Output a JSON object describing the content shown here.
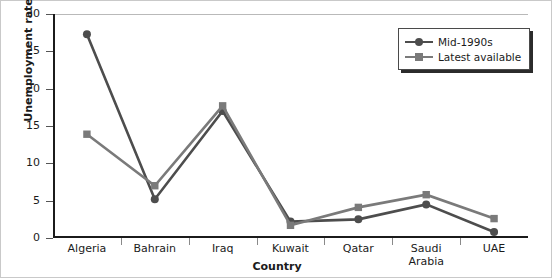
{
  "chart_data": {
    "type": "line",
    "title": "",
    "xlabel": "Country",
    "ylabel": "Unemployment rate (%)",
    "categories": [
      "Algeria",
      "Bahrain",
      "Iraq",
      "Kuwait",
      "Qatar",
      "Saudi Arabia",
      "UAE"
    ],
    "ylim": [
      0,
      30
    ],
    "yticks": [
      0,
      5,
      10,
      15,
      20,
      25,
      30
    ],
    "grid": false,
    "legend_position": "top-right",
    "series": [
      {
        "name": "Mid-1990s",
        "marker": "circle",
        "color": "#4d4d4d",
        "values": [
          27.3,
          5.2,
          17.0,
          2.2,
          2.5,
          4.5,
          0.8
        ]
      },
      {
        "name": "Latest available",
        "marker": "square",
        "color": "#7a7a7a",
        "values": [
          13.9,
          7.0,
          17.7,
          1.7,
          4.1,
          5.8,
          2.6
        ]
      }
    ]
  },
  "axis": {
    "y_tick_labels": [
      "0",
      "5",
      "10",
      "15",
      "20",
      "25",
      "30"
    ],
    "x_tick_labels": [
      "Algeria",
      "Bahrain",
      "Iraq",
      "Kuwait",
      "Qatar",
      "Saudi\nArabia",
      "UAE"
    ]
  },
  "legend": {
    "entries": [
      {
        "label": "Mid-1990s"
      },
      {
        "label": "Latest available"
      }
    ]
  },
  "colors": {
    "series1": "#4d4d4d",
    "series2": "#7a7a7a",
    "axis": "#1b1b1b",
    "frame": "#c9c9c9"
  }
}
